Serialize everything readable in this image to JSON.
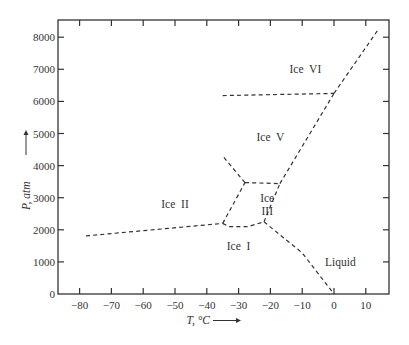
{
  "chart_data": {
    "type": "line",
    "title": "",
    "xlabel": "T, °C",
    "ylabel": "P, atm",
    "xlim": [
      -86,
      17
    ],
    "ylim": [
      0,
      8500
    ],
    "x_ticks": [
      -80,
      -70,
      -60,
      -50,
      -40,
      -30,
      -20,
      -10,
      0,
      10
    ],
    "x_tick_labels": [
      "−80",
      "−70",
      "−60",
      "−50",
      "−40",
      "−30",
      "−20",
      "−10",
      "0",
      "10"
    ],
    "y_ticks": [
      0,
      1000,
      2000,
      3000,
      4000,
      5000,
      6000,
      7000,
      8000
    ],
    "y_tick_labels": [
      "0",
      "1000",
      "2000",
      "3000",
      "4000",
      "5000",
      "6000",
      "7000",
      "8000"
    ],
    "grid": false,
    "legend": "none",
    "line_style": "dashed",
    "regions": [
      {
        "label": "Ice I",
        "x": -30,
        "y": 1500
      },
      {
        "label": "Ice II",
        "x": -50,
        "y": 2800
      },
      {
        "label": "Ice III",
        "x": -21,
        "y": 2800
      },
      {
        "label": "Ice V",
        "x": -20,
        "y": 4900
      },
      {
        "label": "Ice VI",
        "x": -9,
        "y": 7000
      },
      {
        "label": "Liquid",
        "x": 2,
        "y": 1000
      }
    ],
    "series": [
      {
        "name": "Ice I / Ice II",
        "x": [
          -78,
          -35
        ],
        "y": [
          1810,
          2200
        ]
      },
      {
        "name": "Ice I / Ice III",
        "x": [
          -35,
          -33,
          -27,
          -22
        ],
        "y": [
          2200,
          2100,
          2100,
          2250
        ]
      },
      {
        "name": "Ice I / Liquid",
        "x": [
          -22,
          -10,
          0
        ],
        "y": [
          2250,
          1280,
          0
        ]
      },
      {
        "name": "Ice II / Ice III",
        "x": [
          -35,
          -28
        ],
        "y": [
          2200,
          3470
        ]
      },
      {
        "name": "Ice III / Liquid",
        "x": [
          -22,
          -17
        ],
        "y": [
          2250,
          3440
        ]
      },
      {
        "name": "Ice III / Ice V",
        "x": [
          -28,
          -17
        ],
        "y": [
          3470,
          3440
        ]
      },
      {
        "name": "Ice II / Ice V",
        "x": [
          -28,
          -35
        ],
        "y": [
          3470,
          4300
        ]
      },
      {
        "name": "Ice V / Liquid",
        "x": [
          -17,
          0
        ],
        "y": [
          3440,
          6250
        ]
      },
      {
        "name": "Ice V / Ice VI",
        "x": [
          -35,
          0
        ],
        "y": [
          6180,
          6250
        ]
      },
      {
        "name": "Ice VI / Liquid",
        "x": [
          0,
          14
        ],
        "y": [
          6250,
          8250
        ]
      }
    ]
  }
}
